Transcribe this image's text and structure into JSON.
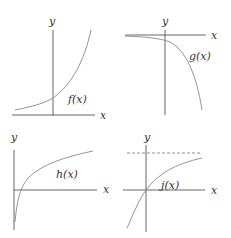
{
  "panels": [
    {
      "id": "f",
      "function_label": "f(x)",
      "x_axis_label": "x",
      "y_axis_label": "y",
      "description": "exponential growth, crosses y-axis above origin, approaches x-axis on left"
    },
    {
      "id": "g",
      "function_label": "g(x)",
      "x_axis_label": "x",
      "y_axis_label": "y",
      "description": "negative exponential, approaches x-axis on left, decreases steeply to the right"
    },
    {
      "id": "h",
      "function_label": "h(x)",
      "x_axis_label": "x",
      "y_axis_label": "y",
      "description": "logarithmic, vertical asymptote at y-axis, crosses x-axis and increases slowly"
    },
    {
      "id": "j",
      "function_label": "j(x)",
      "x_axis_label": "x",
      "y_axis_label": "y",
      "description": "passes through origin, increasing concave down approaching horizontal dashed asymptote"
    }
  ],
  "colors": {
    "axis": "#555555",
    "curve": "#888888",
    "text": "#333333"
  }
}
